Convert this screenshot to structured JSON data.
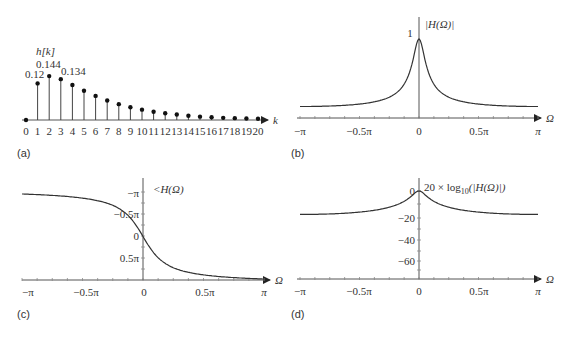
{
  "panels": {
    "a": {
      "label": "(a)",
      "ylabel": "h[k]",
      "xlabel": "k",
      "annotations": [
        "0.12",
        "0.144",
        "0.134"
      ]
    },
    "b": {
      "label": "(b)",
      "ylabel": "|H(Ω)|",
      "xlabel": "Ω",
      "ytick": "1",
      "xticks": [
        "−π",
        "−0.5π",
        "0",
        "0.5π",
        "π"
      ]
    },
    "c": {
      "label": "(c)",
      "ylabel": "<H(Ω)",
      "xlabel": "Ω",
      "yticks": [
        "−π",
        "−0.5π",
        "0",
        "0.5π"
      ],
      "xticks": [
        "−π",
        "−0.5π",
        "0",
        "0.5π",
        "π"
      ]
    },
    "d": {
      "label": "(d)",
      "ylabel_main": "20 × log",
      "ylabel_sub": "10",
      "ylabel_tail": "(|H(Ω)|)",
      "xlabel": "Ω",
      "yticks": [
        "0",
        "−20",
        "−40",
        "−60"
      ],
      "xticks": [
        "−π",
        "−0.5π",
        "0",
        "0.5π",
        "π"
      ]
    }
  },
  "chart_data": [
    {
      "type": "stem",
      "title": "(a)",
      "xlabel": "k",
      "ylabel": "h[k]",
      "x": [
        0,
        1,
        2,
        3,
        4,
        5,
        6,
        7,
        8,
        9,
        10,
        11,
        12,
        13,
        14,
        15,
        16,
        17,
        18,
        19,
        20
      ],
      "values": [
        0,
        0.12,
        0.144,
        0.134,
        0.115,
        0.096,
        0.079,
        0.064,
        0.052,
        0.042,
        0.034,
        0.027,
        0.022,
        0.018,
        0.014,
        0.011,
        0.009,
        0.007,
        0.006,
        0.005,
        0.004
      ],
      "annotations": [
        {
          "k": 1,
          "text": "0.12"
        },
        {
          "k": 2,
          "text": "0.144"
        },
        {
          "k": 3,
          "text": "0.134"
        }
      ]
    },
    {
      "type": "line",
      "title": "(b)",
      "xlabel": "Ω",
      "ylabel": "|H(Ω)|",
      "x_ticks": [
        "−π",
        "−0.5π",
        "0",
        "0.5π",
        "π"
      ],
      "x": [
        -3.1416,
        -2.3562,
        -1.5708,
        -0.7854,
        -0.3927,
        -0.1963,
        0,
        0.1963,
        0.3927,
        0.7854,
        1.5708,
        2.3562,
        3.1416
      ],
      "values": [
        0.09,
        0.1,
        0.13,
        0.27,
        0.5,
        0.78,
        1.0,
        0.78,
        0.5,
        0.27,
        0.13,
        0.1,
        0.09
      ],
      "ylim": [
        0,
        1.1
      ]
    },
    {
      "type": "line",
      "title": "(c)",
      "xlabel": "Ω",
      "ylabel": "<H(Ω)",
      "x_ticks": [
        "−π",
        "−0.5π",
        "0",
        "0.5π",
        "π"
      ],
      "y_ticks": [
        "−π",
        "−0.5π",
        "0",
        "0.5π"
      ],
      "x": [
        -3.1416,
        -2.3562,
        -1.5708,
        -0.7854,
        -0.3927,
        0,
        0.3927,
        0.7854,
        1.5708,
        2.3562,
        3.1416
      ],
      "values": [
        -3.14,
        -2.95,
        -2.6,
        -1.95,
        -1.4,
        0,
        1.4,
        1.95,
        2.6,
        2.95,
        3.14
      ],
      "note": "phase axis drawn inverted (negative up)"
    },
    {
      "type": "line",
      "title": "(d)",
      "xlabel": "Ω",
      "ylabel": "20 × log10(|H(Ω)|)",
      "x_ticks": [
        "−π",
        "−0.5π",
        "0",
        "0.5π",
        "π"
      ],
      "y_ticks": [
        "0",
        "−20",
        "−40",
        "−60"
      ],
      "x": [
        -3.1416,
        -2.3562,
        -1.5708,
        -0.7854,
        -0.3927,
        0,
        0.3927,
        0.7854,
        1.5708,
        2.3562,
        3.1416
      ],
      "values": [
        -24,
        -23,
        -19,
        -12,
        -6,
        0,
        -6,
        -12,
        -19,
        -23,
        -24
      ],
      "ylim": [
        -70,
        5
      ]
    }
  ]
}
